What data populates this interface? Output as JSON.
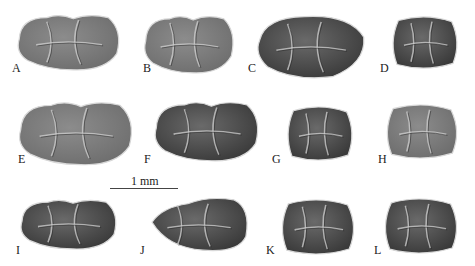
{
  "figure": {
    "type": "specimen-plate",
    "colors": {
      "background": "#ffffff",
      "enamel_dark": "#3a3a3a",
      "enamel_mid": "#6e6e6e",
      "enamel_light": "#a8a8a8",
      "outline": "#d8d8d8"
    },
    "scale_bar": {
      "label": "1 mm",
      "x1": 110,
      "x2": 178,
      "y": 188,
      "label_x": 131,
      "label_y": 175
    },
    "panels": [
      {
        "id": "A",
        "label": "A",
        "label_x": 12,
        "label_y": 62,
        "tooth": {
          "x": 15,
          "y": 13,
          "w": 106,
          "h": 58,
          "shape": "trilobed",
          "tone": "mid"
        }
      },
      {
        "id": "B",
        "label": "B",
        "label_x": 143,
        "label_y": 62,
        "tooth": {
          "x": 142,
          "y": 14,
          "w": 93,
          "h": 60,
          "shape": "trilobed",
          "tone": "mid"
        }
      },
      {
        "id": "C",
        "label": "C",
        "label_x": 248,
        "label_y": 62,
        "tooth": {
          "x": 254,
          "y": 14,
          "w": 112,
          "h": 66,
          "shape": "oval",
          "tone": "dark"
        }
      },
      {
        "id": "D",
        "label": "D",
        "label_x": 380,
        "label_y": 62,
        "tooth": {
          "x": 390,
          "y": 15,
          "w": 70,
          "h": 55,
          "shape": "round",
          "tone": "dark"
        }
      },
      {
        "id": "E",
        "label": "E",
        "label_x": 18,
        "label_y": 153,
        "tooth": {
          "x": 16,
          "y": 100,
          "w": 118,
          "h": 66,
          "shape": "trilobed",
          "tone": "mid"
        }
      },
      {
        "id": "F",
        "label": "F",
        "label_x": 144,
        "label_y": 153,
        "tooth": {
          "x": 152,
          "y": 100,
          "w": 108,
          "h": 62,
          "shape": "trilobed",
          "tone": "dark"
        }
      },
      {
        "id": "G",
        "label": "G",
        "label_x": 272,
        "label_y": 153,
        "tooth": {
          "x": 285,
          "y": 105,
          "w": 70,
          "h": 57,
          "shape": "round",
          "tone": "dark"
        }
      },
      {
        "id": "H",
        "label": "H",
        "label_x": 378,
        "label_y": 153,
        "tooth": {
          "x": 384,
          "y": 103,
          "w": 76,
          "h": 57,
          "shape": "round",
          "tone": "mid"
        }
      },
      {
        "id": "I",
        "label": "I",
        "label_x": 16,
        "label_y": 244,
        "tooth": {
          "x": 18,
          "y": 198,
          "w": 100,
          "h": 52,
          "shape": "trilobed",
          "tone": "dark"
        }
      },
      {
        "id": "J",
        "label": "J",
        "label_x": 140,
        "label_y": 244,
        "tooth": {
          "x": 147,
          "y": 197,
          "w": 102,
          "h": 56,
          "shape": "elongate",
          "tone": "dark"
        }
      },
      {
        "id": "K",
        "label": "K",
        "label_x": 266,
        "label_y": 244,
        "tooth": {
          "x": 279,
          "y": 198,
          "w": 78,
          "h": 58,
          "shape": "round",
          "tone": "dark"
        }
      },
      {
        "id": "L",
        "label": "L",
        "label_x": 374,
        "label_y": 244,
        "tooth": {
          "x": 382,
          "y": 197,
          "w": 78,
          "h": 58,
          "shape": "round",
          "tone": "dark"
        }
      }
    ]
  }
}
